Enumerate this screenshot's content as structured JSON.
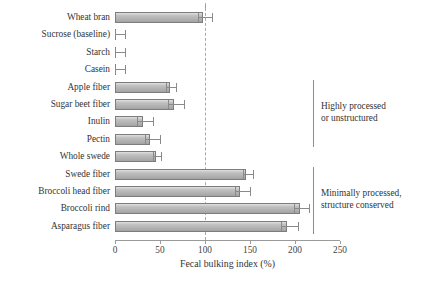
{
  "chart_data": {
    "type": "bar",
    "orientation": "horizontal",
    "title": "",
    "xlabel": "Fecal bulking index (%)",
    "ylabel": "",
    "xlim": [
      0,
      250
    ],
    "xticks": [
      0,
      50,
      100,
      150,
      200,
      250
    ],
    "xticklabels": [
      "0",
      "50",
      "100",
      "150",
      "200",
      "250"
    ],
    "grid": false,
    "reference_line": {
      "value": 100,
      "style": "dashed",
      "label": ""
    },
    "categories": [
      "Wheat bran",
      "Sucrose (baseline)",
      "Starch",
      "Casein",
      "Apple fiber",
      "Sugar beet fiber",
      "Inulin",
      "Pectin",
      "Whole swede",
      "Swede fiber",
      "Broccoli head fiber",
      "Broccoli rind",
      "Asparagus fiber"
    ],
    "values": [
      98,
      0,
      0,
      0,
      61,
      65,
      31,
      39,
      45,
      146,
      139,
      205,
      191
    ],
    "errors": [
      10,
      11,
      11,
      11,
      7,
      12,
      11,
      11,
      6,
      7,
      11,
      11,
      12
    ],
    "bar_color": "#b9b9b9",
    "bar_edge_color": "#7d7d7d",
    "error_color": "#8a8a8a",
    "annotations": [
      {
        "text_line1": "Highly processed",
        "text_line2": "or unstructured",
        "covers": [
          "Apple fiber",
          "Sugar beet fiber",
          "Inulin",
          "Pectin"
        ]
      },
      {
        "text_line1": "Minimally processed,",
        "text_line2": "structure conserved",
        "covers": [
          "Swede fiber",
          "Broccoli head fiber",
          "Broccoli rind",
          "Asparagus fiber"
        ]
      }
    ]
  }
}
